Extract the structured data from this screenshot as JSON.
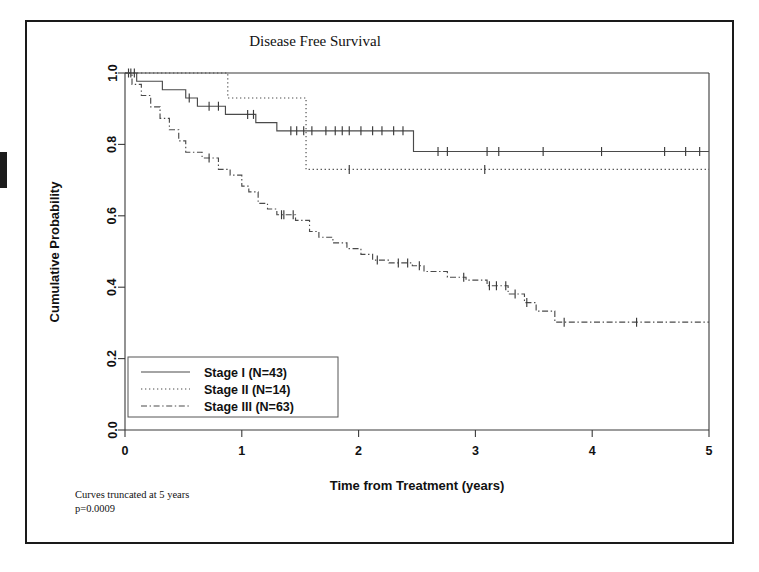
{
  "figure": {
    "title": "Disease Free Survival",
    "footnote_line1": "Curves truncated at 5 years",
    "footnote_line2": "p=0.0009"
  },
  "chart_data": {
    "type": "line",
    "subtype": "kaplan-meier-step",
    "title": "Disease Free Survival",
    "xlabel": "Time from Treatment (years)",
    "ylabel": "Cumulative Probability",
    "xlim": [
      0,
      5
    ],
    "ylim": [
      0,
      1
    ],
    "xticks": [
      0,
      1,
      2,
      3,
      4,
      5
    ],
    "xtick_labels": [
      "0",
      "1",
      "2",
      "3",
      "4",
      "5"
    ],
    "yticks": [
      0.0,
      0.2,
      0.4,
      0.6,
      0.8,
      1.0
    ],
    "ytick_labels": [
      "0.0",
      "0.2",
      "0.4",
      "0.6",
      "0.8",
      "1.0"
    ],
    "grid": false,
    "legend_position": "lower-left",
    "annotations": [
      "Curves truncated at 5 years",
      "p=0.0009"
    ],
    "series": [
      {
        "name": "Stage I (N=43)",
        "label": "Stage I",
        "n": 43,
        "linestyle": "solid",
        "color": "#4a4a4a",
        "steps": [
          [
            0.0,
            1.0
          ],
          [
            0.1,
            0.977
          ],
          [
            0.32,
            0.953
          ],
          [
            0.52,
            0.93
          ],
          [
            0.62,
            0.907
          ],
          [
            0.86,
            0.884
          ],
          [
            1.02,
            0.884
          ],
          [
            1.12,
            0.861
          ],
          [
            1.22,
            0.861
          ],
          [
            1.3,
            0.838
          ],
          [
            2.47,
            0.838
          ],
          [
            2.47,
            0.78
          ],
          [
            5.0,
            0.78
          ]
        ],
        "censor_times": [
          0.05,
          0.08,
          0.55,
          0.72,
          0.8,
          1.05,
          1.1,
          1.42,
          1.47,
          1.53,
          1.6,
          1.72,
          1.8,
          1.86,
          1.92,
          2.02,
          2.12,
          2.2,
          2.3,
          2.38,
          2.68,
          2.76,
          3.1,
          3.2,
          3.58,
          4.08,
          4.62,
          4.8,
          4.92
        ]
      },
      {
        "name": "Stage II (N=14)",
        "label": "Stage II",
        "n": 14,
        "linestyle": "dotted",
        "color": "#4a4a4a",
        "steps": [
          [
            0.0,
            1.0
          ],
          [
            0.88,
            1.0
          ],
          [
            0.88,
            0.93
          ],
          [
            1.55,
            0.93
          ],
          [
            1.55,
            0.73
          ],
          [
            5.0,
            0.73
          ]
        ],
        "censor_times": [
          0.03,
          1.92,
          3.08
        ]
      },
      {
        "name": "Stage III (N=63)",
        "label": "Stage III",
        "n": 63,
        "linestyle": "dashdot",
        "color": "#4a4a4a",
        "steps": [
          [
            0.0,
            1.0
          ],
          [
            0.06,
            0.968
          ],
          [
            0.14,
            0.937
          ],
          [
            0.22,
            0.905
          ],
          [
            0.3,
            0.873
          ],
          [
            0.38,
            0.841
          ],
          [
            0.46,
            0.81
          ],
          [
            0.52,
            0.778
          ],
          [
            0.66,
            0.762
          ],
          [
            0.8,
            0.73
          ],
          [
            0.9,
            0.714
          ],
          [
            1.0,
            0.683
          ],
          [
            1.06,
            0.667
          ],
          [
            1.14,
            0.635
          ],
          [
            1.22,
            0.619
          ],
          [
            1.3,
            0.603
          ],
          [
            1.46,
            0.587
          ],
          [
            1.58,
            0.556
          ],
          [
            1.66,
            0.54
          ],
          [
            1.78,
            0.524
          ],
          [
            1.9,
            0.508
          ],
          [
            2.02,
            0.492
          ],
          [
            2.12,
            0.476
          ],
          [
            2.26,
            0.468
          ],
          [
            2.46,
            0.46
          ],
          [
            2.56,
            0.444
          ],
          [
            2.76,
            0.428
          ],
          [
            2.92,
            0.42
          ],
          [
            3.1,
            0.404
          ],
          [
            3.28,
            0.381
          ],
          [
            3.42,
            0.357
          ],
          [
            3.52,
            0.333
          ],
          [
            3.68,
            0.302
          ],
          [
            5.0,
            0.302
          ]
        ],
        "censor_times": [
          0.72,
          1.34,
          1.36,
          1.44,
          2.16,
          2.34,
          2.42,
          2.52,
          2.9,
          3.12,
          3.18,
          3.26,
          3.34,
          3.44,
          3.76,
          4.38
        ]
      }
    ]
  },
  "legend": {
    "entries": [
      {
        "label": "Stage I (N=43)",
        "style": "solid"
      },
      {
        "label": "Stage II (N=14)",
        "style": "dotted"
      },
      {
        "label": "Stage III (N=63)",
        "style": "dashdot"
      }
    ]
  }
}
